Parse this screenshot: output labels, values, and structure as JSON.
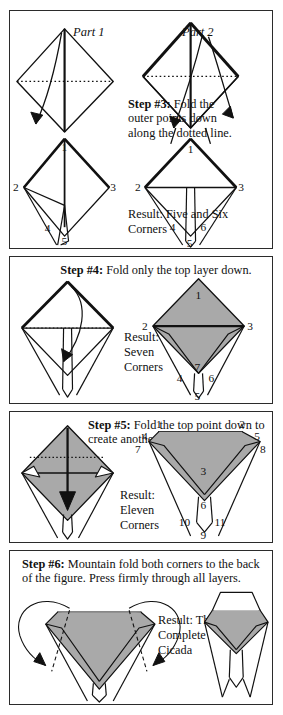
{
  "document": {
    "title": "Origami Cicada Folding Instructions",
    "page_background": "#ffffff",
    "ink_color": "#111111",
    "shade_color": "#a9a9a9"
  },
  "panels": [
    {
      "id": "step3",
      "step_label": "Step #3:",
      "instruction": "Fold the outer points down along the dotted line.",
      "caption_full": "Step #3: Fold the outer points down along the dotted line.",
      "result_text": "Result: Five and Six Corners",
      "part_labels": [
        "Part 1",
        "Part 2"
      ],
      "corner_numbers_left": [
        "1",
        "2",
        "3",
        "4",
        "5"
      ],
      "corner_numbers_right": [
        "1",
        "2",
        "3",
        "4",
        "5",
        "6"
      ]
    },
    {
      "id": "step4",
      "step_label": "Step #4:",
      "instruction": "Fold only the top layer down.",
      "caption_full": "Step #4: Fold only the top layer down.",
      "result_text": "Result: Seven Corners",
      "corner_numbers": [
        "1",
        "2",
        "3",
        "4",
        "5",
        "6",
        "7"
      ]
    },
    {
      "id": "step5",
      "step_label": "Step #5:",
      "instruction": "Fold the top point down to create another triangular layer.",
      "caption_full": "Step #5: Fold the top point down to create another triangular layer.",
      "result_text": "Result: Eleven Corners",
      "corner_numbers": [
        "1",
        "2",
        "3",
        "4",
        "5",
        "6",
        "7",
        "8",
        "9",
        "10",
        "11"
      ]
    },
    {
      "id": "step6",
      "step_label": "Step #6:",
      "instruction": "Mountain fold both corners to the back of the figure. Press firmly through all layers.",
      "caption_full": "Step #6: Mountain fold both corners to the back of the figure. Press firmly through all layers.",
      "result_text": "Result: The Complete Cicada"
    }
  ]
}
